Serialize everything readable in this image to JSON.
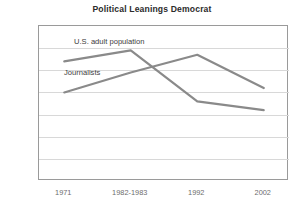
{
  "chart_data": {
    "type": "line",
    "title": "Political Leanings Democrat",
    "xlabel": "",
    "ylabel": "",
    "categories": [
      "1971",
      "1982-1983",
      "1992",
      "2002"
    ],
    "ylim": [
      15,
      50
    ],
    "ytick_step": 5,
    "yticks": [
      15,
      20,
      25,
      30,
      35,
      40,
      45,
      50
    ],
    "grid": true,
    "legend_position": "inline-annotation",
    "series": [
      {
        "name": "U.S. adult population",
        "values": [
          42,
          44.5,
          33,
          31
        ],
        "color": "#8a8a8a",
        "label_x_pct": 14,
        "label_y_value": 46.5
      },
      {
        "name": "Journalists",
        "values": [
          35,
          39.5,
          43.5,
          36
        ],
        "color": "#8a8a8a",
        "label_x_pct": 10,
        "label_y_value": 39.3
      }
    ]
  },
  "axes": {
    "ytick_labels": [
      "50",
      "45",
      "40",
      "35",
      "30",
      "25",
      "20",
      "15"
    ],
    "xtick_labels": [
      "1971",
      "1982-1983",
      "1992",
      "2002"
    ]
  },
  "colors": {
    "line": "#8a8a8a",
    "grid": "#d8d8d8",
    "frame": "#9a9a9a",
    "tick_text": "#6d6d6d",
    "title_text": "#2b2b2b",
    "label_text": "#3c3c3c",
    "background": "#ffffff"
  }
}
